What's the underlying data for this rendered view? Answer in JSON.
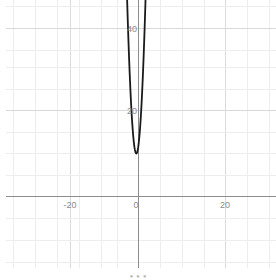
{
  "chart_data": {
    "type": "line",
    "title": "",
    "subtitle": "",
    "xlabel": "",
    "ylabel": "",
    "xlim": [
      -32.5,
      31.5
    ],
    "ylim": [
      -19.5,
      45.5
    ],
    "grid": true,
    "grid_step_x": 5,
    "grid_step_y": 5,
    "legend": "none",
    "axes": {
      "x_axis_value": 0,
      "y_axis_value": 0,
      "x_ticks": [
        -20,
        0,
        20
      ],
      "x_tick_labels": [
        "-20",
        "0",
        "20"
      ],
      "y_ticks": [
        20,
        40
      ],
      "y_tick_labels": [
        "20",
        "40"
      ]
    },
    "series": [
      {
        "name": "parabola",
        "equation": "y = 8x^2 + 8x + 12",
        "vertex": [
          -0.5,
          10.0
        ],
        "color": "#1a1a1a",
        "linewidth": 1.8,
        "x": [
          -2.65,
          -2.5,
          -2.25,
          -2.0,
          -1.75,
          -1.5,
          -1.25,
          -1.0,
          -0.75,
          -0.5,
          -0.25,
          0.0,
          0.25,
          0.5,
          0.75,
          1.0,
          1.25,
          1.5,
          1.65
        ],
        "y": [
          46.9,
          42.0,
          34.5,
          28.0,
          22.5,
          18.0,
          14.5,
          12.0,
          10.5,
          10.0,
          10.5,
          12.0,
          14.5,
          18.0,
          22.5,
          28.0,
          34.5,
          42.0,
          47.0
        ]
      }
    ],
    "colors": {
      "curve": "#1a1a1a",
      "axis": "#8d8d8d",
      "grid_minor": "#ececec",
      "grid_major": "#dcdcdc",
      "tick_text": "#8a8a8a",
      "background": "#ffffff"
    }
  },
  "caption": {
    "text": "• • •"
  },
  "icons": {
    "curve": "parabola-curve-icon"
  }
}
